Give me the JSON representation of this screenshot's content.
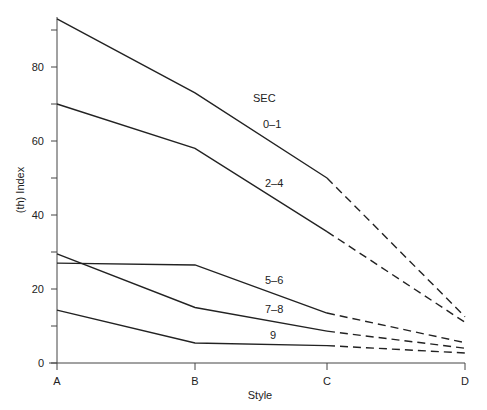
{
  "chart_data": {
    "type": "line",
    "title": "",
    "xlabel": "Style",
    "ylabel": "(th) Index",
    "categories": [
      "A",
      "B",
      "C",
      "D"
    ],
    "ylim": [
      0,
      93
    ],
    "yticks": [
      0,
      10,
      20,
      30,
      40,
      50,
      60,
      70,
      80,
      90
    ],
    "ytick_labels": [
      "0",
      "",
      "20",
      "",
      "40",
      "",
      "60",
      "",
      "80",
      ""
    ],
    "grid": false,
    "legend_title": "SEC",
    "legend_position": "inline labels",
    "series": [
      {
        "name": "0–1",
        "values": [
          93,
          73,
          50,
          12.5
        ],
        "dashed_from": "C"
      },
      {
        "name": "2–4",
        "values": [
          70,
          58,
          35.5,
          11
        ],
        "dashed_from": "C"
      },
      {
        "name": "5–6",
        "values": [
          27,
          26.5,
          13.5,
          5.5
        ],
        "dashed_from": "C"
      },
      {
        "name": "7–8",
        "values": [
          29.5,
          15,
          8.6,
          4
        ],
        "dashed_from": "C"
      },
      {
        "name": "9",
        "values": [
          14.3,
          5.4,
          4.7,
          2.7
        ],
        "dashed_from": "C"
      }
    ]
  },
  "labels": {
    "legend_title": "SEC",
    "series_labels": [
      {
        "text": "0–1",
        "x": 263,
        "y": 128
      },
      {
        "text": "2–4",
        "x": 265,
        "y": 187
      },
      {
        "text": "5–6",
        "x": 265,
        "y": 284
      },
      {
        "text": "7–8",
        "x": 265,
        "y": 313
      },
      {
        "text": "9",
        "x": 270,
        "y": 339
      }
    ],
    "legend_title_pos": {
      "x": 253,
      "y": 102
    }
  },
  "colors": {
    "line": "#222222",
    "axis": "#444444",
    "background": "#ffffff"
  }
}
